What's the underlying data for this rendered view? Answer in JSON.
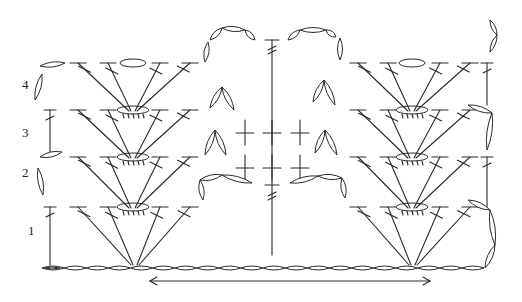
{
  "diagram": {
    "type": "crochet-stitch-chart",
    "colors": {
      "ink": "#2a2a2a",
      "background": "#ffffff"
    },
    "row_labels": [
      {
        "text": "1",
        "x": 28,
        "y": 235
      },
      {
        "text": "2",
        "x": 22,
        "y": 177
      },
      {
        "text": "3",
        "x": 22,
        "y": 137
      },
      {
        "text": "4",
        "x": 22,
        "y": 89
      }
    ],
    "foundation_chain": {
      "x_start": 42,
      "x_end": 484,
      "y": 268,
      "count": 20
    },
    "repeat_arrow": {
      "x_start": 150,
      "x_end": 430,
      "y": 281
    },
    "fans": [
      {
        "name": "left",
        "base_x": 135,
        "shell_x": 133,
        "stem_tops": [
          78,
          108,
          160,
          190
        ]
      },
      {
        "name": "right",
        "base_x": 413,
        "shell_x": 412,
        "stem_tops": [
          358,
          388,
          440,
          470
        ]
      }
    ],
    "rows_y": {
      "r1": 207,
      "r2": 157,
      "r3": 110,
      "r4": 63
    },
    "center_column": {
      "x": 272,
      "y_top": 40,
      "y_bottom": 255
    },
    "center_crosses": {
      "xs": [
        245,
        272,
        300
      ],
      "ys": [
        133,
        168
      ]
    },
    "edge_columns": [
      {
        "x": 50,
        "segments": [
          [
            207,
            265
          ],
          [
            110,
            152
          ]
        ]
      },
      {
        "x": 487,
        "segments": [
          [
            157,
            207
          ],
          [
            63,
            105
          ]
        ]
      }
    ]
  }
}
